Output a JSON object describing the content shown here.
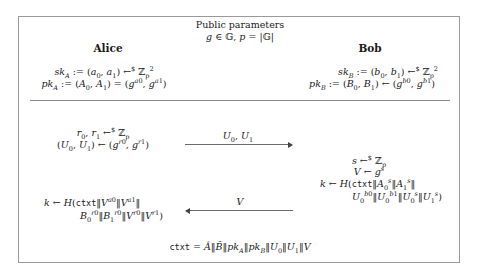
{
  "header": {
    "title": "Public parameters",
    "params": "g ∈ 𝔾, p = |𝔾|"
  },
  "parties": {
    "alice": {
      "name": "Alice",
      "sk": "sk_A := (a_0, a_1) ←$ ℤ_p^2",
      "pk": "pk_A := (A_0, A_1) = (g^a0, g^a1)"
    },
    "bob": {
      "name": "Bob",
      "sk": "sk_B := (b_0, b_1) ←$ ℤ_p^2",
      "pk": "pk_B := (B_0, B_1) ← (g^b0, g^b1)"
    }
  },
  "protocol": {
    "alice_step1": [
      "r_0, r_1 ←$ ℤ_p",
      "(U_0, U_1) ← (g^r0, g^r1)"
    ],
    "msg1": {
      "label": "U_0, U_1",
      "direction": "right"
    },
    "bob_step": [
      "s ←$ ℤ_p",
      "V ← g^s",
      "k ← H(ctxt‖A_0^s‖A_1^s‖",
      "U_0^b0‖U_0^b1‖U_0^s‖U_1^s)"
    ],
    "msg2": {
      "label": "V",
      "direction": "left"
    },
    "alice_step2": [
      "k ← H(ctxt‖V^a0‖V^a1‖",
      "B_0^r0‖B_1^r0‖V^r0‖V^r1)"
    ],
    "footer": "ctxt = Â‖B̂‖pk_A‖pk_B‖U_0‖U_1‖V"
  }
}
